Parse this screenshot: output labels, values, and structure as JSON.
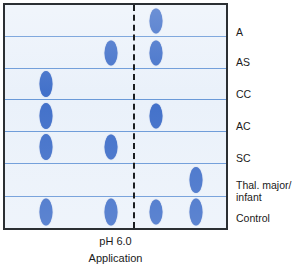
{
  "figure": {
    "box": {
      "border_color": "#2b2f33",
      "background_color": "#eaf1fa"
    },
    "lane_divider_color": "#5b8fd4",
    "spot_color": "#2f62c4",
    "application_line": {
      "name": "application-origin-line",
      "style": "dashed",
      "color": "#1a1d20",
      "x_pct": 58.0
    }
  },
  "caption": {
    "ph": "pH 6.0",
    "application": "Application"
  },
  "chart_data": {
    "type": "scatter",
    "xlabel": "Migration position",
    "ylabel": "Sample lane",
    "grid": false,
    "legend": "none",
    "annotations": [
      "pH 6.0",
      "Application"
    ],
    "origin_x_pct": 58.0,
    "x_positions_pct": {
      "pos1": 18.5,
      "pos2": 47.8,
      "pos3": 68.5,
      "pos4": 86.2
    },
    "categories": [
      "A",
      "AS",
      "CC",
      "AC",
      "SC",
      "Thal. major/\ninfant",
      "Control"
    ],
    "lanes": [
      {
        "label": "A",
        "top_pct": 0.0,
        "height_pct": 14.4,
        "spots": [
          {
            "x_pct": 68.5,
            "y_pct": 50,
            "w": 13,
            "h": 25
          }
        ]
      },
      {
        "label": "AS",
        "top_pct": 14.4,
        "height_pct": 14.2,
        "spots": [
          {
            "x_pct": 47.8,
            "y_pct": 52,
            "w": 13,
            "h": 25
          },
          {
            "x_pct": 68.5,
            "y_pct": 52,
            "w": 13,
            "h": 25
          }
        ]
      },
      {
        "label": "CC",
        "top_pct": 28.6,
        "height_pct": 14.2,
        "spots": [
          {
            "x_pct": 18.5,
            "y_pct": 50,
            "w": 13,
            "h": 26
          }
        ]
      },
      {
        "label": "AC",
        "top_pct": 42.8,
        "height_pct": 14.2,
        "spots": [
          {
            "x_pct": 18.5,
            "y_pct": 50,
            "w": 13,
            "h": 26
          },
          {
            "x_pct": 68.5,
            "y_pct": 50,
            "w": 13,
            "h": 25
          }
        ]
      },
      {
        "label": "SC",
        "top_pct": 57.0,
        "height_pct": 14.2,
        "spots": [
          {
            "x_pct": 18.5,
            "y_pct": 50,
            "w": 13,
            "h": 26
          },
          {
            "x_pct": 47.8,
            "y_pct": 50,
            "w": 13,
            "h": 25
          }
        ]
      },
      {
        "label": "Thal. major/\ninfant",
        "top_pct": 71.2,
        "height_pct": 14.9,
        "spots": [
          {
            "x_pct": 86.2,
            "y_pct": 50,
            "w": 13,
            "h": 26
          }
        ]
      },
      {
        "label": "Control",
        "top_pct": 86.1,
        "height_pct": 13.9,
        "spots": [
          {
            "x_pct": 18.5,
            "y_pct": 50,
            "w": 13,
            "h": 27
          },
          {
            "x_pct": 47.8,
            "y_pct": 50,
            "w": 13,
            "h": 27
          },
          {
            "x_pct": 68.5,
            "y_pct": 50,
            "w": 13,
            "h": 25
          },
          {
            "x_pct": 86.2,
            "y_pct": 50,
            "w": 13,
            "h": 27
          }
        ]
      }
    ],
    "labels_y_pct": [
      10.5,
      24.0,
      38.0,
      52.0,
      66.0,
      78.0,
      92.5
    ]
  }
}
